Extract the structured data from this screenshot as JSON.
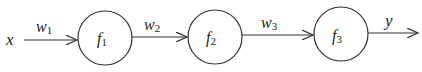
{
  "diagram": {
    "input_label": "x",
    "output_label": "y",
    "nodes": [
      {
        "name": "f",
        "sub": "1"
      },
      {
        "name": "f",
        "sub": "2"
      },
      {
        "name": "f",
        "sub": "3"
      }
    ],
    "edges": [
      {
        "name": "w",
        "sub": "1"
      },
      {
        "name": "w",
        "sub": "2"
      },
      {
        "name": "w",
        "sub": "3"
      }
    ],
    "colors": {
      "stroke": "#333333",
      "background": "#ffffff"
    }
  }
}
